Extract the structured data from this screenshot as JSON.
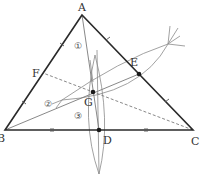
{
  "diagram": {
    "colors": {
      "side": "#2a2a2a",
      "median": "#777777",
      "construction": "#888888",
      "point": "#1a1a1a",
      "text": "#333333"
    },
    "points": {
      "A": {
        "label": "A",
        "x": 82,
        "y": 15
      },
      "B": {
        "label": "B",
        "x": 5,
        "y": 130
      },
      "C": {
        "label": "C",
        "x": 193,
        "y": 130
      },
      "D": {
        "label": "D",
        "x": 99,
        "y": 130
      },
      "E": {
        "label": "E",
        "x": 139,
        "y": 74
      },
      "F": {
        "label": "F",
        "x": 43,
        "y": 73
      },
      "G": {
        "label": "G",
        "x": 93,
        "y": 92
      }
    },
    "region_labels": [
      {
        "text": "①",
        "x": 79,
        "y": 46
      },
      {
        "text": "②",
        "x": 49,
        "y": 104
      },
      {
        "text": "③",
        "x": 79,
        "y": 116
      }
    ],
    "segments": {
      "sides": [
        "AB",
        "BC",
        "CA"
      ],
      "medians_solid": [
        "AD",
        "BE"
      ],
      "medians_dashed": [
        "CF"
      ]
    },
    "tick_marks": {
      "AF_FB": "single",
      "AE_EC": "single",
      "BD_DC": "double"
    }
  }
}
